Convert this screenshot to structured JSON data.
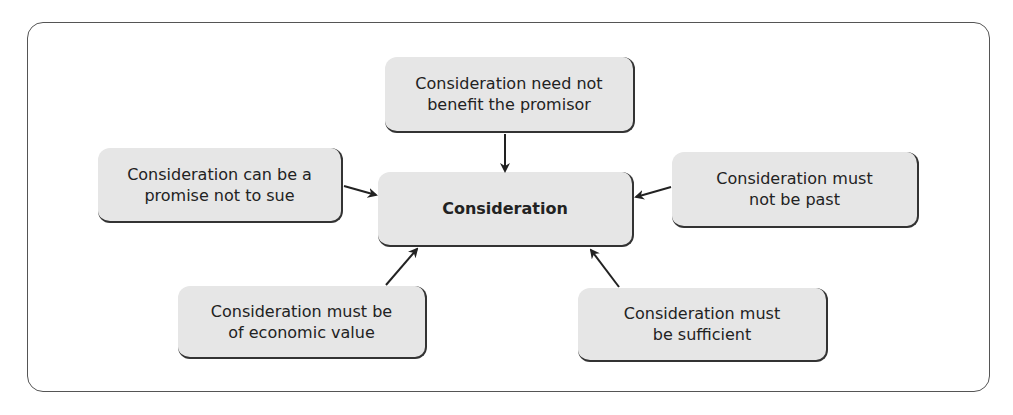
{
  "diagram": {
    "center": {
      "label": "Consideration"
    },
    "nodes": [
      {
        "id": "top",
        "label": "Consideration need not\nbenefit the promisor"
      },
      {
        "id": "left",
        "label": "Consideration can be a\npromise not to sue"
      },
      {
        "id": "right",
        "label": "Consideration must\nnot be past"
      },
      {
        "id": "bottom-left",
        "label": "Consideration must be\nof economic value"
      },
      {
        "id": "bottom-right",
        "label": "Consideration must\nbe sufficient"
      }
    ],
    "edges": [
      {
        "from": "top",
        "to": "center"
      },
      {
        "from": "left",
        "to": "center"
      },
      {
        "from": "right",
        "to": "center"
      },
      {
        "from": "bottom-left",
        "to": "center"
      },
      {
        "from": "bottom-right",
        "to": "center"
      }
    ],
    "colors": {
      "box_fill": "#e6e6e6",
      "box_shadow": "#333333",
      "frame": "#555555",
      "text": "#222222"
    }
  }
}
